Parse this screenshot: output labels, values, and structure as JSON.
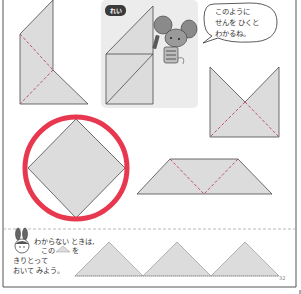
{
  "example": {
    "badge_label": "れい"
  },
  "speech_bubble": {
    "lines": [
      "このように",
      "せんを ひくと",
      "わかるね。"
    ]
  },
  "hint": {
    "lines": [
      "わからない ときは,",
      "この",
      "を",
      "きりとって",
      "おいて みよう。"
    ]
  },
  "page_number": "32",
  "colors": {
    "shape_fill": "#dcdcdc",
    "shape_stroke": "#4a4a4a",
    "dashed_line": "#c0506a",
    "answer_circle": "#e8384f",
    "example_bg": "#ececec",
    "border": "#555555",
    "separator": "#aaaaaa"
  },
  "shapes": [
    {
      "name": "tall-pentagon",
      "has_dashed_guides": true
    },
    {
      "name": "example-shape",
      "has_solid_guides": true
    },
    {
      "name": "bowtie-shape",
      "has_dashed_guides": true
    },
    {
      "name": "diamond-square",
      "selected_answer": true
    },
    {
      "name": "trapezoid",
      "has_dashed_guides": true
    }
  ]
}
